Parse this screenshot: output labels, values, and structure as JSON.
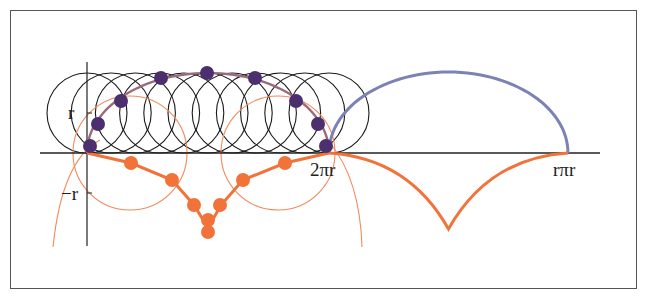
{
  "figure": {
    "labels": {
      "y_pos": "r",
      "y_neg": "−r",
      "x_mid": "2πr",
      "x_end": "rπr"
    },
    "colors": {
      "frame": "#555555",
      "axis": "#222222",
      "circles": "#1a1a1a",
      "purple_points": "#4b2f6e",
      "blue_arc": "#7d82b5",
      "orange": "#f2733a",
      "orange_thin": "#f08a5a"
    },
    "geometry": {
      "origin": [
        87,
        153
      ],
      "r_px": 40,
      "two_pi_r_x": 329,
      "end_x": 568,
      "circle_count": 11
    }
  }
}
